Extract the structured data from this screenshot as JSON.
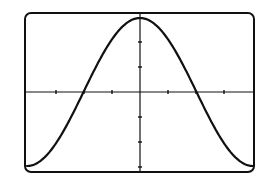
{
  "chart_data": {
    "type": "line",
    "title": "",
    "xlabel": "",
    "ylabel": "",
    "function": "y = cos(x)",
    "xlim": [
      -3.14159,
      3.14159
    ],
    "ylim": [
      -1,
      1
    ],
    "x_tick_spacing_px": 28,
    "y_tick_spacing_px": 25,
    "grid": false,
    "legend": null,
    "series": [
      {
        "name": "cos(x)",
        "x": [
          -3.14159,
          -2.35619,
          -1.5708,
          -0.7854,
          0,
          0.7854,
          1.5708,
          2.35619,
          3.14159
        ],
        "values": [
          -1,
          -0.7071,
          0,
          0.7071,
          1,
          0.7071,
          0,
          -0.7071,
          -1
        ]
      }
    ]
  },
  "colors": {
    "background": "#ffffff",
    "ink": "#111111"
  }
}
